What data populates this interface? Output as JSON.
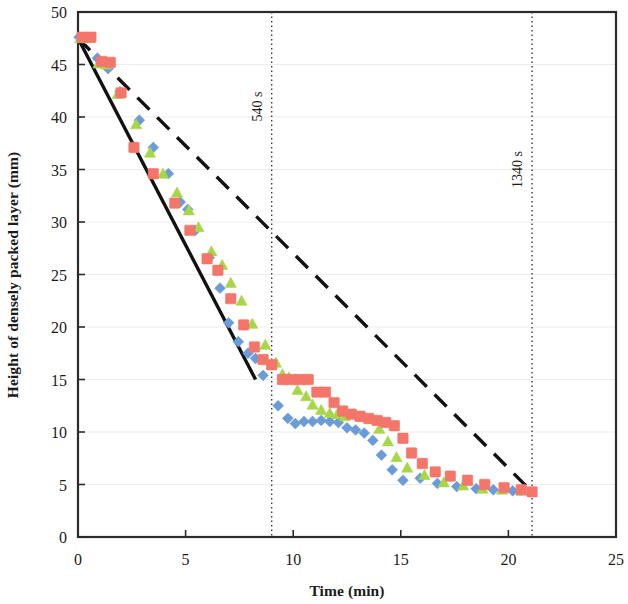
{
  "chart_data": {
    "type": "scatter",
    "title": "",
    "xlabel": "Time (min)",
    "ylabel": "Height of densely packed layer (mm)",
    "xlim": [
      0,
      25
    ],
    "ylim": [
      0,
      50
    ],
    "xticks": [
      0,
      5,
      10,
      15,
      20,
      25
    ],
    "yticks": [
      0,
      5,
      10,
      15,
      20,
      25,
      30,
      35,
      40,
      45,
      50
    ],
    "xtick_labels": [
      "0",
      "5",
      "10",
      "15",
      "20",
      "25"
    ],
    "ytick_labels": [
      "0",
      "5",
      "10",
      "15",
      "20",
      "25",
      "30",
      "35",
      "40",
      "45",
      "50"
    ],
    "grid": "horizontal-faint",
    "legend": "none",
    "series": [
      {
        "name": "run-1-blue-diamond",
        "marker": "diamond",
        "color": "#6b9bd8",
        "points": [
          [
            0.05,
            47.6
          ],
          [
            0.35,
            47.5
          ],
          [
            0.9,
            45.6
          ],
          [
            1.15,
            45.2
          ],
          [
            1.4,
            44.6
          ],
          [
            1.95,
            42.4
          ],
          [
            2.85,
            39.7
          ],
          [
            3.5,
            37.1
          ],
          [
            4.2,
            34.6
          ],
          [
            4.75,
            31.9
          ],
          [
            5.1,
            31.2
          ],
          [
            5.45,
            29.2
          ],
          [
            6.1,
            26.6
          ],
          [
            6.6,
            23.7
          ],
          [
            7.0,
            20.4
          ],
          [
            7.45,
            18.6
          ],
          [
            7.9,
            17.5
          ],
          [
            8.25,
            17.0
          ],
          [
            8.6,
            15.4
          ],
          [
            9.3,
            12.5
          ],
          [
            9.75,
            11.3
          ],
          [
            10.1,
            10.8
          ],
          [
            10.5,
            11.0
          ],
          [
            10.9,
            11.0
          ],
          [
            11.3,
            11.1
          ],
          [
            11.7,
            11.0
          ],
          [
            12.1,
            10.9
          ],
          [
            12.5,
            10.4
          ],
          [
            12.9,
            10.2
          ],
          [
            13.3,
            9.9
          ],
          [
            13.7,
            9.2
          ],
          [
            14.1,
            7.8
          ],
          [
            14.6,
            6.4
          ],
          [
            15.1,
            5.4
          ],
          [
            15.9,
            5.6
          ],
          [
            16.7,
            5.1
          ],
          [
            17.6,
            4.8
          ],
          [
            18.5,
            4.6
          ],
          [
            19.3,
            4.5
          ],
          [
            20.2,
            4.4
          ]
        ]
      },
      {
        "name": "run-2-green-triangle",
        "marker": "triangle",
        "color": "#a8d64a",
        "points": [
          [
            0.1,
            47.5
          ],
          [
            0.45,
            47.5
          ],
          [
            0.95,
            45.1
          ],
          [
            1.3,
            45.0
          ],
          [
            1.85,
            42.2
          ],
          [
            2.7,
            39.3
          ],
          [
            3.35,
            36.6
          ],
          [
            3.95,
            34.6
          ],
          [
            4.6,
            32.8
          ],
          [
            5.15,
            31.1
          ],
          [
            5.6,
            29.5
          ],
          [
            6.2,
            27.2
          ],
          [
            6.7,
            25.9
          ],
          [
            7.1,
            24.2
          ],
          [
            7.6,
            22.5
          ],
          [
            8.1,
            20.3
          ],
          [
            8.7,
            18.3
          ],
          [
            9.2,
            16.6
          ],
          [
            9.5,
            15.5
          ],
          [
            9.8,
            15.2
          ],
          [
            10.2,
            14.0
          ],
          [
            10.6,
            13.4
          ],
          [
            10.9,
            12.6
          ],
          [
            11.3,
            12.1
          ],
          [
            11.7,
            11.8
          ],
          [
            12.05,
            11.7
          ],
          [
            12.4,
            11.5
          ],
          [
            12.8,
            11.7
          ],
          [
            13.2,
            11.4
          ],
          [
            13.6,
            11.2
          ],
          [
            14.0,
            10.3
          ],
          [
            14.4,
            9.1
          ],
          [
            14.8,
            7.6
          ],
          [
            15.3,
            6.6
          ],
          [
            16.1,
            5.9
          ],
          [
            17.0,
            5.2
          ],
          [
            17.9,
            4.9
          ],
          [
            18.8,
            4.6
          ],
          [
            19.7,
            4.5
          ],
          [
            20.6,
            4.4
          ]
        ]
      },
      {
        "name": "run-3-red-square",
        "marker": "square",
        "color": "#f4766a",
        "points": [
          [
            0.2,
            47.6
          ],
          [
            0.6,
            47.6
          ],
          [
            1.1,
            45.3
          ],
          [
            1.5,
            45.2
          ],
          [
            2.0,
            42.3
          ],
          [
            2.6,
            37.1
          ],
          [
            3.5,
            34.6
          ],
          [
            4.5,
            31.8
          ],
          [
            5.2,
            29.2
          ],
          [
            6.0,
            26.5
          ],
          [
            6.5,
            25.4
          ],
          [
            7.1,
            22.7
          ],
          [
            7.7,
            20.2
          ],
          [
            8.2,
            18.1
          ],
          [
            8.6,
            16.9
          ],
          [
            9.0,
            16.4
          ],
          [
            9.5,
            15.0
          ],
          [
            9.9,
            15.0
          ],
          [
            10.3,
            15.0
          ],
          [
            10.7,
            15.0
          ],
          [
            11.1,
            13.8
          ],
          [
            11.5,
            13.8
          ],
          [
            11.9,
            12.8
          ],
          [
            12.3,
            12.0
          ],
          [
            12.7,
            11.7
          ],
          [
            13.1,
            11.5
          ],
          [
            13.5,
            11.3
          ],
          [
            13.9,
            11.1
          ],
          [
            14.3,
            10.9
          ],
          [
            14.7,
            10.6
          ],
          [
            15.1,
            9.4
          ],
          [
            15.5,
            8.0
          ],
          [
            16.0,
            7.0
          ],
          [
            16.6,
            6.2
          ],
          [
            17.3,
            5.8
          ],
          [
            18.1,
            5.4
          ],
          [
            18.9,
            5.0
          ],
          [
            19.8,
            4.7
          ],
          [
            20.6,
            4.5
          ],
          [
            21.1,
            4.3
          ]
        ]
      }
    ],
    "trend_lines": [
      {
        "name": "solid-trend-line",
        "style": "solid",
        "color": "#111111",
        "from": [
          0,
          47.5
        ],
        "to": [
          8.25,
          15.0
        ]
      },
      {
        "name": "dashed-trend-line",
        "style": "dashed",
        "color": "#111111",
        "from": [
          0,
          47.5
        ],
        "to": [
          21.1,
          4.3
        ]
      }
    ],
    "annotations": [
      {
        "name": "marker-540s",
        "label": "540 s",
        "x": 9.0,
        "orientation": "vertical-dotted",
        "label_y": 41
      },
      {
        "name": "marker-1340s",
        "label": "1340 s",
        "x": 21.1,
        "orientation": "vertical-dotted",
        "label_y": 35
      }
    ]
  }
}
